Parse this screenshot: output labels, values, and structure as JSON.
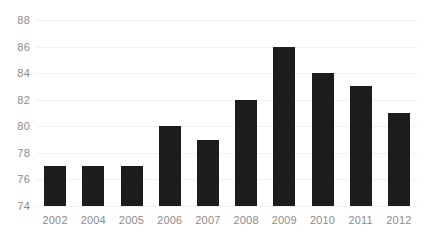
{
  "chart_data": {
    "type": "bar",
    "title": "",
    "subtitle": "",
    "xlabel": "",
    "ylabel": "",
    "categories": [
      "2002",
      "2004",
      "2005",
      "2006",
      "2007",
      "2008",
      "2009",
      "2010",
      "2011",
      "2012"
    ],
    "values": [
      77,
      77,
      77,
      80,
      79,
      82,
      86,
      84,
      83,
      81
    ],
    "series": [
      {
        "name": "",
        "values": [
          77,
          77,
          77,
          80,
          79,
          82,
          86,
          84,
          83,
          81
        ]
      }
    ],
    "ylim": [
      74,
      88
    ],
    "ytick_step": 2,
    "ytick_labels": [
      "88",
      "86",
      "84",
      "82",
      "80",
      "78",
      "76",
      "74"
    ],
    "ytick_values": [
      88,
      86,
      84,
      82,
      80,
      78,
      76,
      74
    ],
    "grid": true,
    "grid_axis": "y",
    "legend": false,
    "legend_position": "none",
    "annotations": [],
    "colors": {
      "bar": "#1c1c1c",
      "gridline": "#f1f1f1",
      "tick_label": "#8c8c8c",
      "background": "#ffffff"
    }
  }
}
